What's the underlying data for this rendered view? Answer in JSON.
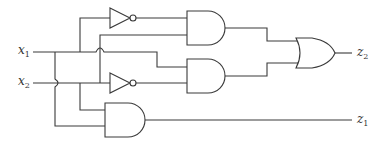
{
  "diagram": {
    "type": "logic-circuit",
    "inputs": [
      {
        "name": "x",
        "sub": "1",
        "y": 52
      },
      {
        "name": "x",
        "sub": "2",
        "y": 83
      }
    ],
    "outputs": [
      {
        "name": "z",
        "sub": "2",
        "y": 53
      },
      {
        "name": "z",
        "sub": "1",
        "y": 120
      }
    ],
    "gates": [
      {
        "id": "not-top",
        "type": "NOT",
        "input": "x1"
      },
      {
        "id": "not-bottom",
        "type": "NOT",
        "input": "x2"
      },
      {
        "id": "and-top",
        "type": "AND",
        "inputs": [
          "NOT x1",
          "x2"
        ]
      },
      {
        "id": "and-middle",
        "type": "AND",
        "inputs": [
          "x1",
          "NOT x2"
        ]
      },
      {
        "id": "and-bottom",
        "type": "AND",
        "inputs": [
          "x2",
          "x1"
        ],
        "output": "z1"
      },
      {
        "id": "or",
        "type": "OR",
        "inputs": [
          "and-top",
          "and-middle"
        ],
        "output": "z2"
      }
    ],
    "colors": {
      "line": "#3a3a3a",
      "background": "#ffffff"
    }
  }
}
